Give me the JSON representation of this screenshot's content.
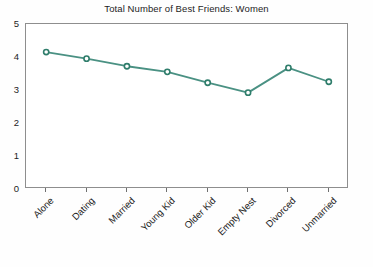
{
  "chart_data": {
    "type": "line",
    "title": "Total Number of Best Friends: Women",
    "xlabel": "",
    "ylabel": "",
    "categories": [
      "Alone",
      "Dating",
      "Married",
      "Young Kid",
      "Older Kid",
      "Empty Nest",
      "Divorced",
      "Unmarried"
    ],
    "values": [
      4.15,
      3.95,
      3.72,
      3.55,
      3.22,
      2.92,
      3.67,
      3.25
    ],
    "series": [
      {
        "name": "Women",
        "values": [
          4.15,
          3.95,
          3.72,
          3.55,
          3.22,
          2.92,
          3.67,
          3.25
        ]
      }
    ],
    "ylim": [
      0,
      5
    ],
    "yticks": [
      0,
      1,
      2,
      3,
      4,
      5
    ],
    "ytick_labels": [
      "0",
      "1",
      "2",
      "3",
      "4",
      "5"
    ],
    "grid": false,
    "legend": "none",
    "line_color": "#4a9183",
    "marker": "open-circle",
    "marker_color": "#2f7d6b",
    "axis_color": "#8e8e8e",
    "background": "#ffffff"
  }
}
